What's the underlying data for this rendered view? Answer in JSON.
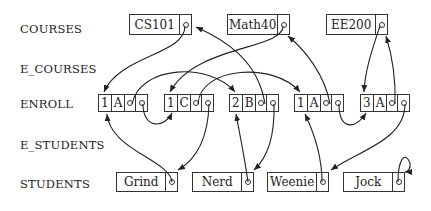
{
  "row_labels": {
    "courses": "COURSES",
    "e_courses": "E_COURSES",
    "enroll": "ENROLL",
    "e_students": "E_STUDENTS",
    "students": "STUDENTS"
  },
  "courses": [
    {
      "name": "CS101"
    },
    {
      "name": "Math40"
    },
    {
      "name": "EE200"
    }
  ],
  "enroll": [
    {
      "num": "1",
      "grade": "A"
    },
    {
      "num": "1",
      "grade": "C"
    },
    {
      "num": "2",
      "grade": "B"
    },
    {
      "num": "1",
      "grade": "A"
    },
    {
      "num": "3",
      "grade": "A"
    }
  ],
  "students": [
    {
      "name": "Grind"
    },
    {
      "name": "Nerd"
    },
    {
      "name": "Weenie"
    },
    {
      "name": "Jock"
    }
  ],
  "colors": {
    "line": "#222222",
    "background": "#ffffff"
  }
}
